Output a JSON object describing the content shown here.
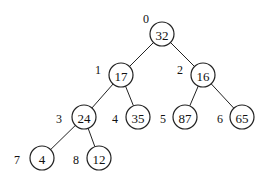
{
  "diagram": {
    "type": "binary-heap-tree",
    "nodes": [
      {
        "index": "0",
        "value": "32",
        "cx": 162,
        "cy": 34,
        "ix": 146,
        "iy": 19
      },
      {
        "index": "1",
        "value": "17",
        "cx": 121,
        "cy": 75,
        "ix": 98,
        "iy": 70
      },
      {
        "index": "2",
        "value": "16",
        "cx": 203,
        "cy": 75,
        "ix": 180,
        "iy": 70
      },
      {
        "index": "3",
        "value": "24",
        "cx": 84,
        "cy": 117,
        "ix": 59,
        "iy": 119
      },
      {
        "index": "4",
        "value": "35",
        "cx": 138,
        "cy": 117,
        "ix": 115,
        "iy": 119
      },
      {
        "index": "5",
        "value": "87",
        "cx": 185,
        "cy": 117,
        "ix": 163,
        "iy": 119
      },
      {
        "index": "6",
        "value": "65",
        "cx": 242,
        "cy": 117,
        "ix": 220,
        "iy": 119
      },
      {
        "index": "7",
        "value": "4",
        "cx": 42,
        "cy": 158,
        "ix": 17,
        "iy": 160
      },
      {
        "index": "8",
        "value": "12",
        "cx": 99,
        "cy": 158,
        "ix": 76,
        "iy": 160
      }
    ],
    "edges": [
      {
        "from": 0,
        "to": 1
      },
      {
        "from": 0,
        "to": 2
      },
      {
        "from": 1,
        "to": 3
      },
      {
        "from": 1,
        "to": 4
      },
      {
        "from": 2,
        "to": 5
      },
      {
        "from": 2,
        "to": 6
      },
      {
        "from": 3,
        "to": 7
      },
      {
        "from": 3,
        "to": 8
      }
    ],
    "node_radius": 12
  }
}
